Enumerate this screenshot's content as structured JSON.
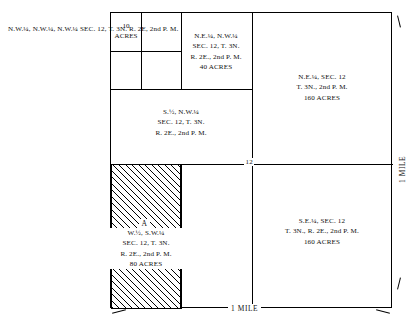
{
  "diagram": {
    "title_note": "Public Land Survey System section subdivision diagram",
    "section_number": "12",
    "side_caption": {
      "line1": "N.W.¼, N.W.¼, N.W.¼",
      "line2": "SEC. 12,  T. 3N.",
      "line3": "R. 2E,  2nd P. M."
    },
    "cells": {
      "ten_acres": {
        "line1": "10",
        "line2": "ACRES"
      },
      "ne_nw": {
        "line1": "N.E.¼,  N.W.¼",
        "line2": "SEC. 12,  T. 3N.",
        "line3": "R. 2E.,  2nd P. M.",
        "line4": "40 ACRES"
      },
      "s_half_nw": {
        "line1": "S.½,  N.W.¼",
        "line2": "SEC. 12,  T. 3N.",
        "line3": "R. 2E.,  2nd P. M."
      },
      "ne_quarter": {
        "line1": "N.E.¼,  SEC. 12",
        "line2": "T. 3N.,  2nd P. M.",
        "line3": "160 ACRES"
      },
      "se_quarter": {
        "line1": "S.E.¼,  SEC. 12",
        "line2": "T. 3N.,  R. 2E.,  2nd P. M.",
        "line3": "160 ACRES"
      },
      "w_half_sw": {
        "parcel_letter": "A",
        "line1": "W.½,  S.W.¼",
        "line2": "SEC. 12,  T. 3N.",
        "line3": "R. 2E.,  2nd P. M.",
        "line4": "80 ACRES"
      }
    },
    "scale_labels": {
      "bottom": "1 MILE",
      "right": "1 MILE"
    },
    "colors": {
      "ink": "#111111",
      "line": "#000000",
      "background": "#ffffff"
    }
  }
}
